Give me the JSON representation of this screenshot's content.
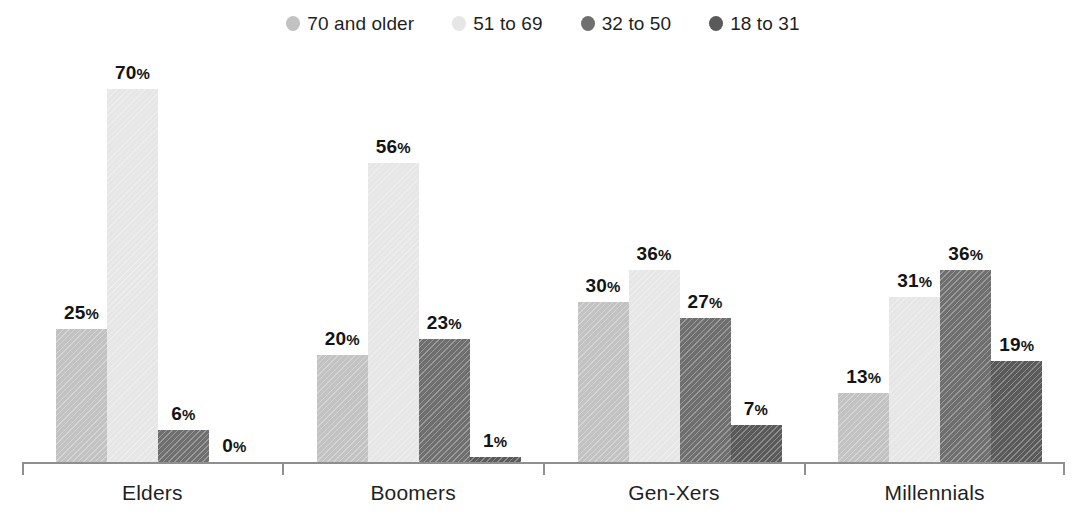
{
  "chart_data": {
    "type": "bar",
    "title": "",
    "xlabel": "",
    "ylabel": "",
    "ylim": [
      0,
      78
    ],
    "grid": false,
    "legend_position": "top-center",
    "categories": [
      "Elders",
      "Boomers",
      "Gen-Xers",
      "Millennials"
    ],
    "series": [
      {
        "name": "70 and older",
        "color": "#c2c2c2",
        "values": [
          25,
          20,
          30,
          13
        ],
        "labels": [
          "25%",
          "20%",
          "30%",
          "13%"
        ]
      },
      {
        "name": "51 to 69",
        "color": "#e6e6e6",
        "values": [
          70,
          56,
          36,
          31
        ],
        "labels": [
          "70%",
          "56%",
          "36%",
          "31%"
        ]
      },
      {
        "name": "32 to 50",
        "color": "#6f6f6f",
        "values": [
          6,
          23,
          27,
          36
        ],
        "labels": [
          "6%",
          "23%",
          "27%",
          "36%"
        ]
      },
      {
        "name": "18 to 31",
        "color": "#5a5a5a",
        "values": [
          0,
          1,
          7,
          19
        ],
        "labels": [
          "0%",
          "1%",
          "7%",
          "19%"
        ]
      }
    ]
  },
  "legend": {
    "items": [
      {
        "label": "70 and older",
        "color": "#c2c2c2"
      },
      {
        "label": "51 to 69",
        "color": "#e6e6e6"
      },
      {
        "label": "32 to 50",
        "color": "#6f6f6f"
      },
      {
        "label": "18 to 31",
        "color": "#5a5a5a"
      }
    ]
  },
  "axis": {
    "line_color": "#8f8f8f",
    "tick_count": 5
  }
}
